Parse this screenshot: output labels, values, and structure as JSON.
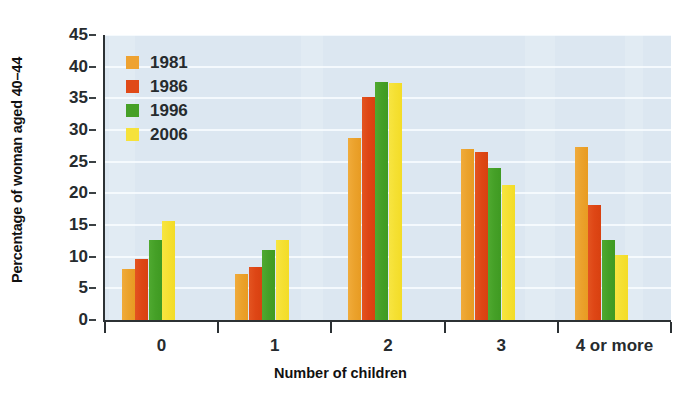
{
  "chart_data": {
    "type": "bar",
    "title": "",
    "xlabel": "Number of children",
    "ylabel": "Percentage of woman aged 40–44",
    "categories": [
      "0",
      "1",
      "2",
      "3",
      "4 or more"
    ],
    "ylim": [
      0,
      45
    ],
    "ytick_step": 5,
    "yticks": [
      "0",
      "5",
      "10",
      "15",
      "20",
      "25",
      "30",
      "35",
      "40",
      "45"
    ],
    "grid": "horizontal",
    "legend_position": "top-left inside plot",
    "series": [
      {
        "name": "1981",
        "color": "#eea231",
        "values": [
          8.1,
          7.2,
          28.8,
          27.0,
          27.3
        ]
      },
      {
        "name": "1986",
        "color": "#e04a18",
        "values": [
          9.7,
          8.4,
          35.2,
          26.5,
          18.1
        ]
      },
      {
        "name": "1996",
        "color": "#46a027",
        "values": [
          12.6,
          11.0,
          37.6,
          24.0,
          12.7
        ]
      },
      {
        "name": "2006",
        "color": "#f6e23a",
        "values": [
          15.6,
          12.6,
          37.4,
          21.3,
          10.3
        ]
      }
    ]
  },
  "legend": {
    "items": [
      {
        "label": "1981"
      },
      {
        "label": "1986"
      },
      {
        "label": "1996"
      },
      {
        "label": "2006"
      }
    ]
  },
  "colors": {
    "plot_background": "#dce7f1",
    "gridline": "#f4f9fd",
    "axis": "#2c3134",
    "text": "#262b2e"
  }
}
